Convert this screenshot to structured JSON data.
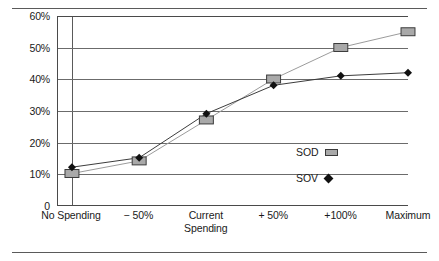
{
  "chart_data": {
    "type": "line",
    "title": "",
    "subtitle": "",
    "xlabel": "",
    "ylabel": "",
    "categories": [
      "No Spending",
      "− 50%",
      "Current\nSpending",
      "+ 50%",
      "+100%",
      "Maximum"
    ],
    "ytick_labels": [
      "0",
      "10%",
      "20%",
      "30%",
      "40%",
      "50%",
      "60%"
    ],
    "ytick_values": [
      0,
      10,
      20,
      30,
      40,
      50,
      60
    ],
    "ylim": [
      0,
      60
    ],
    "grid": "horizontal",
    "legend_position": "inside-right",
    "series": [
      {
        "name": "SOD",
        "marker": "square",
        "marker_color": "#a9a9a9",
        "line_color": "#9a9a9a",
        "values": [
          10,
          14,
          27,
          40,
          50,
          55
        ]
      },
      {
        "name": "SOV",
        "marker": "diamond",
        "marker_color": "#111111",
        "line_color": "#3a3a3a",
        "values": [
          12,
          15,
          29,
          38,
          41,
          42
        ]
      }
    ]
  },
  "legend": {
    "items": [
      {
        "label": "SOD",
        "marker": "square"
      },
      {
        "label": "SOV",
        "marker": "diamond"
      }
    ]
  },
  "colors": {
    "axis": "#4a4a4a",
    "grid": "#6b6b6b",
    "sod_fill": "#a9a9a9",
    "sov_fill": "#111111",
    "rule": "#5a5a5a",
    "background": "#ffffff"
  }
}
